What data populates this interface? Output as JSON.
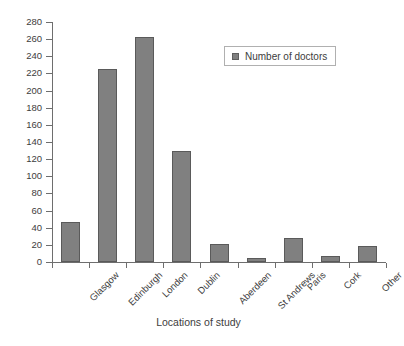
{
  "chart_data": {
    "type": "bar",
    "title": "",
    "xlabel": "Locations of study",
    "ylabel": "",
    "ylim": [
      0,
      280
    ],
    "ytick_step": 20,
    "grid": false,
    "legend_position": "top-right",
    "series_name": "Number of doctors",
    "bar_color": "#808080",
    "bar_edge_color": "#5a5a5a",
    "axis_color": "#6e6e6e",
    "text_color": "#3d3d3d",
    "categories": [
      "Glasgow",
      "Edinburgh",
      "London",
      "Dublin",
      "Aberdeen",
      "St Andrews",
      "Paris",
      "Cork",
      "Other"
    ],
    "values": [
      47,
      225,
      262,
      130,
      21,
      5,
      28,
      7,
      19
    ],
    "ytick_labels": [
      "0",
      "20",
      "40",
      "60",
      "80",
      "100",
      "120",
      "140",
      "160",
      "180",
      "200",
      "220",
      "240",
      "260",
      "280"
    ],
    "ytick_values": [
      0,
      20,
      40,
      60,
      80,
      100,
      120,
      140,
      160,
      180,
      200,
      220,
      240,
      260,
      280
    ]
  },
  "legend": {
    "entries": [
      {
        "label": "Number of doctors",
        "color": "#808080"
      }
    ]
  }
}
